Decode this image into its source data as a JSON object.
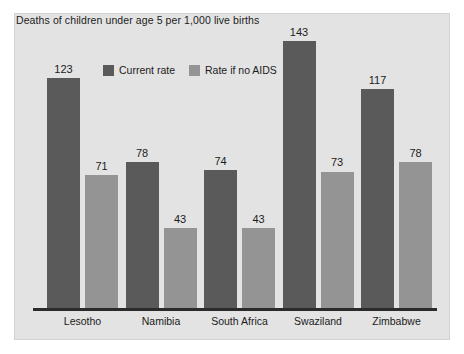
{
  "chart_data": {
    "type": "bar",
    "title": "Deaths of children under age 5 per 1,000 live births",
    "xlabel": "",
    "ylabel": "",
    "ylim": [
      0,
      160
    ],
    "grid": false,
    "legend_position": "top-center-inside",
    "categories": [
      "Lesotho",
      "Namibia",
      "South Africa",
      "Swaziland",
      "Zimbabwe"
    ],
    "series": [
      {
        "name": "Current rate",
        "color": "#5a5a5a",
        "values": [
          123,
          78,
          74,
          143,
          117
        ]
      },
      {
        "name": "Rate if no AIDS",
        "color": "#949494",
        "values": [
          71,
          43,
          43,
          73,
          78
        ]
      }
    ]
  },
  "colors": {
    "page_background": "#ffffff",
    "panel_background": "#e3e3e3",
    "panel_border": "#d2d2d2",
    "axis_line": "#2b2b2b",
    "text": "#1b1b1b",
    "series_current_rate": "#5a5a5a",
    "series_no_aids": "#949494"
  }
}
